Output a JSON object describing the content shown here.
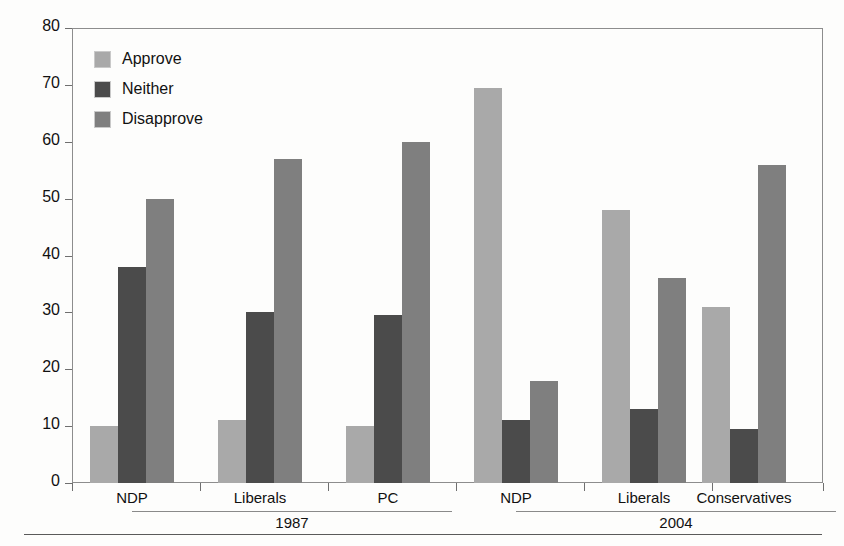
{
  "chart_data": {
    "type": "bar",
    "title": "",
    "xlabel": "",
    "ylabel": "Percent",
    "ylim": [
      0,
      80
    ],
    "yticks": [
      0,
      10,
      20,
      30,
      40,
      50,
      60,
      70,
      80
    ],
    "grid": false,
    "legend_position": "upper-left",
    "categories": [
      "NDP",
      "Liberals",
      "PC",
      "NDP",
      "Liberals",
      "Conservatives"
    ],
    "group_brackets": [
      {
        "label": "1987",
        "categories": [
          "NDP",
          "Liberals",
          "PC"
        ]
      },
      {
        "label": "2004",
        "categories": [
          "NDP",
          "Liberals",
          "Conservatives"
        ]
      }
    ],
    "series": [
      {
        "name": "Approve",
        "color": "#a9a9a9",
        "values": [
          10,
          11,
          10,
          69.5,
          48,
          31
        ]
      },
      {
        "name": "Neither",
        "color": "#4b4b4b",
        "values": [
          38,
          30,
          29.5,
          11,
          13,
          9.5
        ]
      },
      {
        "name": "Disapprove",
        "color": "#7f7f7f",
        "values": [
          50,
          57,
          60,
          18,
          36,
          56
        ]
      }
    ]
  },
  "axis": {
    "ylabel": "Percent",
    "tick_labels": [
      "80",
      "70",
      "60",
      "50",
      "40",
      "30",
      "20",
      "10",
      "0"
    ]
  },
  "legend": {
    "items": [
      {
        "label": "Approve",
        "color": "#a9a9a9",
        "swatch": "approve-swatch"
      },
      {
        "label": "Neither",
        "color": "#4b4b4b",
        "swatch": "neither-swatch"
      },
      {
        "label": "Disapprove",
        "color": "#7f7f7f",
        "swatch": "disapprove-swatch"
      }
    ]
  },
  "x_axis": {
    "group_labels": [
      "NDP",
      "Liberals",
      "PC",
      "NDP",
      "Liberals",
      "Conservatives"
    ],
    "era_labels": [
      "1987",
      "2004"
    ]
  },
  "colors": {
    "approve": "#a9a9a9",
    "neither": "#4b4b4b",
    "disapprove": "#7f7f7f",
    "axis": "#6f6f6f",
    "frame": "#8d8d8d",
    "background": "#fdfdfc",
    "text": "#111111"
  }
}
